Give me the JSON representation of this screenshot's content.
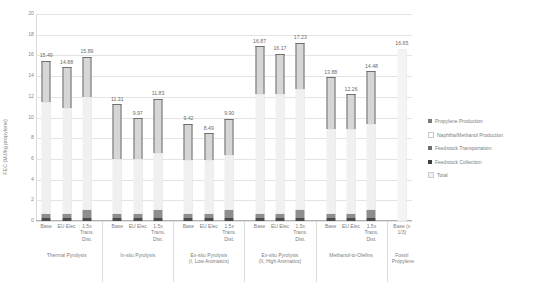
{
  "chart_data": {
    "type": "bar",
    "title": "",
    "xlabel": "",
    "ylabel": "FEC (MJ/kg propylene)",
    "ylim": [
      0,
      20
    ],
    "ytick_labels": [
      "0",
      "2",
      "4",
      "6",
      "8",
      "10",
      "12",
      "14",
      "16",
      "18",
      "20"
    ],
    "grid": true,
    "legend_position": "right",
    "stacked": true,
    "legend": [
      "Propylene Production",
      "Naphtha/Methanol Production",
      "Feedstock Transportation",
      "Feedstock Collection",
      "Total"
    ],
    "groups": [
      {
        "name": "Thermal Pyrolysis",
        "name_line2": "",
        "categories": [
          "Base",
          "EU Elec",
          "1.5x\nTrans.\nDist."
        ],
        "totals": [
          15.49,
          14.88,
          15.89
        ],
        "series": {
          "Feedstock Collection": [
            0.3,
            0.3,
            0.3
          ],
          "Feedstock Transportation": [
            0.35,
            0.35,
            0.8
          ],
          "Naphtha/Methanol Production": [
            10.84,
            10.23,
            10.84
          ],
          "Propylene Production": [
            4.0,
            4.0,
            3.95
          ]
        }
      },
      {
        "name": "In-situ Pyrolysis",
        "name_line2": "",
        "categories": [
          "Base",
          "EU Elec",
          "1.5x\nTrans.\nDist."
        ],
        "totals": [
          11.31,
          9.97,
          11.83
        ],
        "series": {
          "Feedstock Collection": [
            0.3,
            0.3,
            0.3
          ],
          "Feedstock Transportation": [
            0.35,
            0.35,
            0.8
          ],
          "Naphtha/Methanol Production": [
            5.36,
            5.32,
            5.43
          ],
          "Propylene Production": [
            5.3,
            4.0,
            5.3
          ]
        }
      },
      {
        "name": "Ex-situ Pyrolysis",
        "name_line2": "(I, Low Aromatics)",
        "categories": [
          "Base",
          "EU Elec",
          "1.5x\nTrans.\nDist."
        ],
        "totals": [
          9.42,
          8.49,
          9.9
        ],
        "series": {
          "Feedstock Collection": [
            0.3,
            0.3,
            0.3
          ],
          "Feedstock Transportation": [
            0.35,
            0.35,
            0.8
          ],
          "Naphtha/Methanol Production": [
            5.27,
            5.24,
            5.3
          ],
          "Propylene Production": [
            3.5,
            2.6,
            3.5
          ]
        }
      },
      {
        "name": "Ex-situ Pyrolysis",
        "name_line2": "(II, High Aromatics)",
        "categories": [
          "Base",
          "EU Elec",
          "1.5x\nTrans.\nDist."
        ],
        "totals": [
          16.87,
          16.17,
          17.23
        ],
        "series": {
          "Feedstock Collection": [
            0.3,
            0.3,
            0.3
          ],
          "Feedstock Transportation": [
            0.35,
            0.35,
            0.8
          ],
          "Naphtha/Methanol Production": [
            11.62,
            11.62,
            11.63
          ],
          "Propylene Production": [
            4.6,
            3.9,
            4.5
          ]
        }
      },
      {
        "name": "Methanol-to-Olefins",
        "name_line2": "",
        "categories": [
          "Base",
          "EU Elec",
          "1.5x\nTrans.\nDist."
        ],
        "totals": [
          13.88,
          12.26,
          14.48
        ],
        "series": {
          "Feedstock Collection": [
            0.3,
            0.3,
            0.3
          ],
          "Feedstock Transportation": [
            0.35,
            0.35,
            0.8
          ],
          "Naphtha/Methanol Production": [
            8.23,
            8.21,
            8.28
          ],
          "Propylene Production": [
            5.0,
            3.4,
            5.1
          ]
        }
      },
      {
        "name": "Fossil",
        "name_line2": "Propylene",
        "categories": [
          "Base (x\n1/3)"
        ],
        "totals": [
          16.65
        ],
        "series": {
          "Total": [
            16.65
          ]
        }
      }
    ]
  }
}
